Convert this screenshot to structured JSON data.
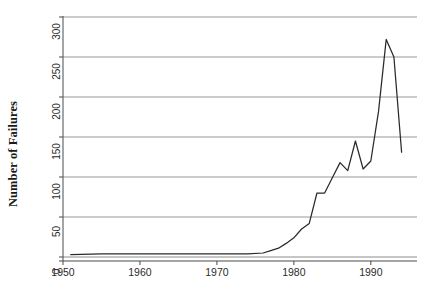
{
  "chart_data": {
    "type": "line",
    "title": "",
    "xlabel": "",
    "ylabel": "Number of Failures",
    "xlim": [
      1950,
      1996
    ],
    "ylim": [
      0,
      300
    ],
    "xticks": [
      1950,
      1960,
      1970,
      1980,
      1990
    ],
    "yticks": [
      0,
      50,
      100,
      150,
      200,
      250,
      300
    ],
    "xtick_labels": [
      "1950",
      "1960",
      "1970",
      "1980",
      "1990"
    ],
    "ytick_labels": [
      "0",
      "50",
      "100",
      "150",
      "200",
      "250",
      "300"
    ],
    "grid": "horizontal",
    "legend": "none",
    "line_color": "#2a2a2a",
    "grid_color": "#8c8c8c",
    "axis_color": "#4a4a4a",
    "background": "#ffffff",
    "x": [
      1951,
      1955,
      1960,
      1965,
      1970,
      1974,
      1976,
      1977,
      1978,
      1979,
      1980,
      1981,
      1982,
      1983,
      1984,
      1985,
      1986,
      1987,
      1988,
      1989,
      1990,
      1991,
      1992,
      1993,
      1994
    ],
    "values": [
      3,
      4,
      4,
      4,
      4,
      4,
      5,
      8,
      11,
      17,
      24,
      35,
      42,
      80,
      80,
      99,
      118,
      108,
      145,
      110,
      120,
      182,
      272,
      250,
      131
    ],
    "series": [
      {
        "name": "Number of Failures",
        "values": [
          3,
          4,
          4,
          4,
          4,
          4,
          5,
          8,
          11,
          17,
          24,
          35,
          42,
          80,
          80,
          99,
          118,
          108,
          145,
          110,
          120,
          182,
          272,
          250,
          131
        ]
      }
    ],
    "annotations": []
  },
  "figure": {
    "y_axis_title": "Number of Failures"
  }
}
